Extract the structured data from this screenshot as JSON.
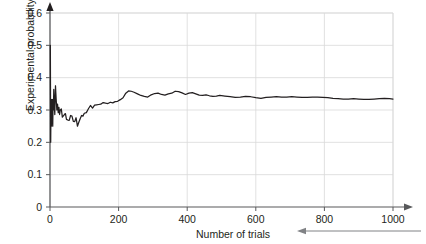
{
  "chart_data": {
    "type": "line",
    "title": "",
    "subtitle": "",
    "xlabel": "Number of trials",
    "ylabel": "Experimental probability",
    "xlim": [
      0,
      1000
    ],
    "ylim": [
      0,
      0.6
    ],
    "xticks": [
      0,
      200,
      400,
      600,
      800,
      1000
    ],
    "xtick_labels": [
      "0",
      "200",
      "400",
      "600",
      "800",
      "1000"
    ],
    "yticks": [
      0,
      0.1,
      0.2,
      0.3,
      0.4,
      0.5,
      0.6
    ],
    "ytick_labels": [
      "0",
      "0.1",
      "0.2",
      "0.3",
      "0.4",
      "0.5",
      "0.6"
    ],
    "grid": true,
    "grid_color": "#d9d9d9",
    "line_color": "#231f20",
    "legend": null,
    "legend_position": "none",
    "annotations": [
      {
        "name": "x-axis-arrowhead",
        "description": "arrow at right end of x-axis"
      },
      {
        "name": "y-axis-arrowhead",
        "description": "arrow at top end of y-axis"
      },
      {
        "name": "xlabel-leader-arrow",
        "description": "long horizontal line with left-pointing arrowhead from right edge to the Number of trials label"
      }
    ],
    "series": [
      {
        "name": "Experimental probability",
        "x": [
          1,
          2,
          3,
          4,
          5,
          6,
          7,
          8,
          9,
          10,
          11,
          12,
          13,
          14,
          15,
          16,
          17,
          18,
          19,
          20,
          22,
          24,
          26,
          28,
          30,
          33,
          36,
          39,
          42,
          45,
          48,
          52,
          56,
          60,
          64,
          68,
          72,
          76,
          80,
          84,
          88,
          92,
          96,
          100,
          106,
          112,
          118,
          124,
          130,
          136,
          142,
          148,
          155,
          162,
          169,
          176,
          183,
          190,
          197,
          205,
          213,
          221,
          229,
          237,
          245,
          255,
          265,
          275,
          285,
          295,
          305,
          315,
          325,
          335,
          345,
          355,
          365,
          375,
          385,
          395,
          405,
          415,
          425,
          435,
          445,
          455,
          465,
          475,
          485,
          495,
          510,
          525,
          540,
          555,
          570,
          585,
          600,
          615,
          630,
          645,
          660,
          675,
          690,
          705,
          720,
          735,
          750,
          765,
          780,
          795,
          810,
          825,
          840,
          855,
          870,
          885,
          900,
          915,
          930,
          945,
          960,
          975,
          990,
          1000
        ],
        "y": [
          0.5,
          0.2,
          0.333,
          0.25,
          0.3,
          0.333,
          0.286,
          0.25,
          0.333,
          0.3,
          0.364,
          0.333,
          0.308,
          0.286,
          0.333,
          0.375,
          0.353,
          0.333,
          0.316,
          0.3,
          0.318,
          0.292,
          0.308,
          0.286,
          0.3,
          0.303,
          0.278,
          0.282,
          0.286,
          0.289,
          0.271,
          0.269,
          0.268,
          0.283,
          0.281,
          0.265,
          0.264,
          0.276,
          0.25,
          0.262,
          0.273,
          0.283,
          0.281,
          0.29,
          0.292,
          0.304,
          0.314,
          0.306,
          0.315,
          0.316,
          0.317,
          0.318,
          0.323,
          0.321,
          0.32,
          0.324,
          0.322,
          0.326,
          0.327,
          0.332,
          0.338,
          0.352,
          0.359,
          0.358,
          0.355,
          0.35,
          0.345,
          0.342,
          0.34,
          0.347,
          0.351,
          0.352,
          0.348,
          0.346,
          0.35,
          0.352,
          0.358,
          0.357,
          0.353,
          0.348,
          0.352,
          0.354,
          0.35,
          0.346,
          0.345,
          0.347,
          0.344,
          0.342,
          0.343,
          0.345,
          0.343,
          0.341,
          0.339,
          0.34,
          0.342,
          0.341,
          0.338,
          0.336,
          0.339,
          0.34,
          0.341,
          0.34,
          0.34,
          0.341,
          0.34,
          0.339,
          0.339,
          0.34,
          0.34,
          0.339,
          0.338,
          0.336,
          0.335,
          0.334,
          0.334,
          0.335,
          0.334,
          0.333,
          0.333,
          0.334,
          0.335,
          0.336,
          0.335,
          0.334
        ]
      }
    ]
  }
}
